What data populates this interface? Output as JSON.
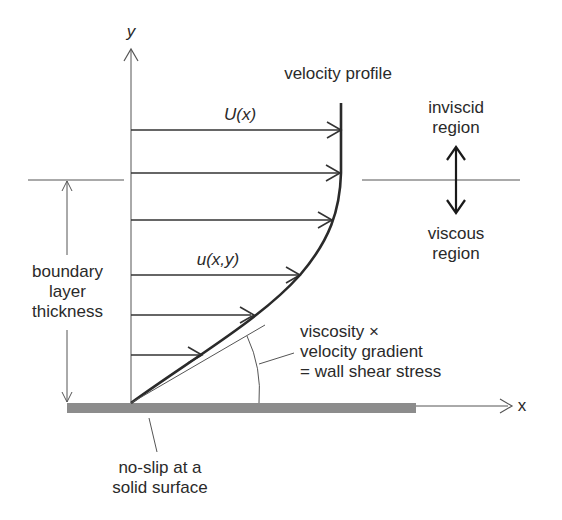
{
  "axes": {
    "y_label": "y",
    "x_label": "x"
  },
  "labels": {
    "velocity_profile": "velocity profile",
    "freestream_velocity": "U(x)",
    "local_velocity": "u(x,y)",
    "inviscid_region": [
      "inviscid",
      "region"
    ],
    "viscous_region": [
      "viscous",
      "region"
    ],
    "boundary_layer_thickness": [
      "boundary",
      "layer",
      "thickness"
    ],
    "wall_shear": [
      "viscosity ×",
      "velocity gradient",
      "= wall shear stress"
    ],
    "no_slip": [
      "no-slip at a",
      "solid surface"
    ]
  },
  "profile_arrows": [
    {
      "y": 130,
      "x_end": 342
    },
    {
      "y": 173,
      "x_end": 341
    },
    {
      "y": 220,
      "x_end": 333
    },
    {
      "y": 275,
      "x_end": 300
    },
    {
      "y": 315,
      "x_end": 253
    },
    {
      "y": 355,
      "x_end": 201
    }
  ],
  "colors": {
    "line": "#333333",
    "wall": "#8c8c8c",
    "thin": "#555555"
  }
}
